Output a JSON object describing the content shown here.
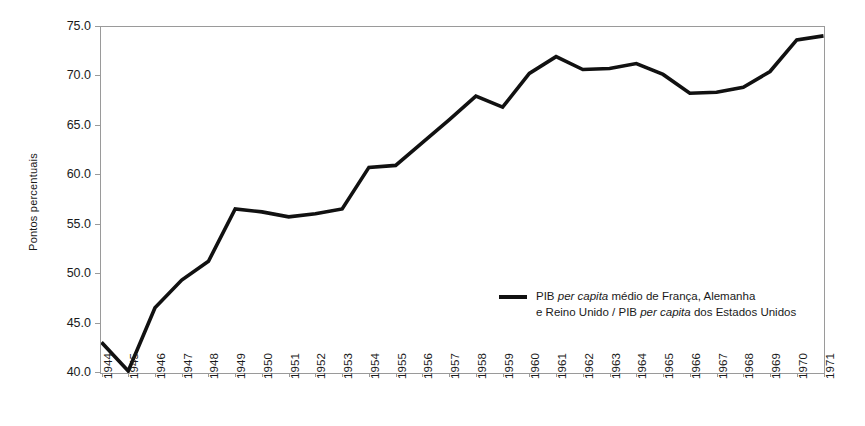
{
  "chart_data": {
    "type": "line",
    "title": "",
    "subtitle": "",
    "xlabel": "",
    "ylabel": "Pontos percentuais",
    "ylim": [
      40.0,
      75.0
    ],
    "yticks": [
      "40.0",
      "45.0",
      "50.0",
      "55.0",
      "60.0",
      "65.0",
      "70.0",
      "75.0"
    ],
    "ytick_values": [
      40.0,
      45.0,
      50.0,
      55.0,
      60.0,
      65.0,
      70.0,
      75.0
    ],
    "grid": false,
    "legend_position": "inside-center-right",
    "categories": [
      "1944",
      "1945",
      "1946",
      "1947",
      "1948",
      "1949",
      "1950",
      "1951",
      "1952",
      "1953",
      "1954",
      "1955",
      "1956",
      "1957",
      "1958",
      "1959",
      "1960",
      "1961",
      "1962",
      "1963",
      "1964",
      "1965",
      "1966",
      "1967",
      "1968",
      "1969",
      "1970",
      "1971"
    ],
    "x": [
      1944,
      1945,
      1946,
      1947,
      1948,
      1949,
      1950,
      1951,
      1952,
      1953,
      1954,
      1955,
      1956,
      1957,
      1958,
      1959,
      1960,
      1961,
      1962,
      1963,
      1964,
      1965,
      1966,
      1967,
      1968,
      1969,
      1970,
      1971
    ],
    "series": [
      {
        "name": "PIB per capita médio de França, Alemanha e Reino Unido / PIB per capita dos Estados Unidos",
        "color": "#111111",
        "values": [
          43.1,
          40.2,
          46.6,
          49.4,
          51.3,
          56.6,
          56.3,
          55.8,
          56.1,
          56.6,
          60.8,
          61.0,
          63.3,
          65.6,
          68.0,
          66.9,
          70.3,
          72.0,
          70.7,
          70.8,
          71.3,
          70.2,
          68.3,
          68.4,
          68.9,
          70.5,
          73.7,
          74.1
        ]
      }
    ],
    "legend": [
      {
        "marker": "line",
        "color": "#111111",
        "line1_pre": "PIB ",
        "line1_italic": "per capita",
        "line1_post": " médio de França, Alemanha",
        "line2_pre": "e Reino Unido / PIB ",
        "line2_italic": "per capita",
        "line2_post": " dos Estados Unidos"
      }
    ]
  }
}
